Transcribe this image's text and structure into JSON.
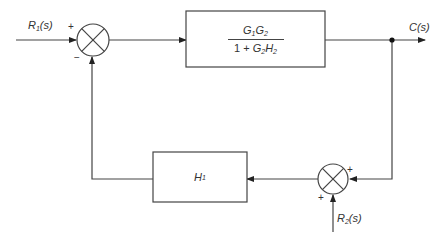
{
  "diagram": {
    "type": "block-diagram",
    "inputs": {
      "r1": {
        "base": "R",
        "sub": "1",
        "arg": "(s)"
      },
      "r2": {
        "base": "R",
        "sub": "2",
        "arg": "(s)"
      }
    },
    "output": {
      "label": "C(s)",
      "base": "C",
      "arg": "(s)"
    },
    "forward_block": {
      "numerator": {
        "a": "G",
        "a_sub": "1",
        "b": "G",
        "b_sub": "2"
      },
      "denominator": {
        "prefix": "1 + ",
        "a": "G",
        "a_sub": "2",
        "b": "H",
        "b_sub": "2"
      }
    },
    "feedback_block": {
      "base": "H",
      "sub": "1"
    },
    "summing_junction_1": {
      "sign_input": "+",
      "sign_feedback": "−"
    },
    "summing_junction_2": {
      "sign_output_feedback": "+",
      "sign_r2": "+"
    },
    "line_color": "#444444"
  }
}
